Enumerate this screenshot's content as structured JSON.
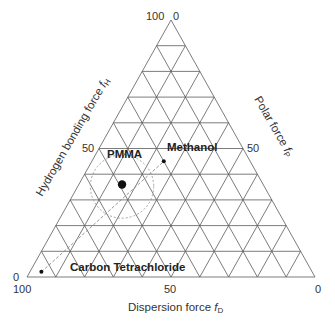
{
  "chart_data": {
    "type": "ternary",
    "title": "",
    "axes": {
      "bottom": {
        "label": "Dispersion force ",
        "sub": "D",
        "var": "f",
        "ticks": [
          "100",
          "50",
          "0"
        ],
        "direction": "100 at left, 0 at right"
      },
      "left": {
        "label": "Hydrogen bonding force ",
        "sub": "H",
        "var": "f",
        "ticks": [
          "0",
          "50",
          "100"
        ],
        "direction": "0 at bottom-left, 100 at apex"
      },
      "right": {
        "label": "Polar force ",
        "sub": "P",
        "var": "f",
        "ticks": [
          "0",
          "50"
        ],
        "direction": "0 at apex, 100 at bottom-right"
      }
    },
    "grid": {
      "divisions": 10,
      "step": 10
    },
    "points": [
      {
        "name": "PMMA",
        "fD": 49,
        "fP": 15,
        "fH": 36,
        "size": "large"
      },
      {
        "name": "Methanol",
        "fD": 30,
        "fP": 25,
        "fH": 45,
        "size": "small"
      },
      {
        "name": "Carbon Tetrachloride",
        "fD": 94,
        "fP": 4,
        "fH": 2,
        "size": "small"
      }
    ],
    "annotations": [
      {
        "type": "dotted-circle",
        "center": "PMMA",
        "radius_units": 11
      },
      {
        "type": "dashed-line",
        "from": "Carbon Tetrachloride",
        "to": "Methanol"
      }
    ]
  },
  "labels": {
    "apex_left": "100",
    "apex_right": "0",
    "left_mid": "50",
    "right_mid": "50",
    "bl_left": "0",
    "bl_bottom": "100",
    "bottom_mid": "50",
    "br": "0",
    "pmma": "PMMA",
    "methanol": "Methanol",
    "ccl4": "Carbon Tetrachloride",
    "x_axis": "Dispersion force ",
    "x_axis_var": "f",
    "x_axis_sub": "D",
    "left_axis": "Hydrogen bonding force ",
    "left_axis_var": "f",
    "left_axis_sub": "H",
    "right_axis": "Polar force ",
    "right_axis_var": "f",
    "right_axis_sub": "P"
  },
  "colors": {
    "grid": "#555555",
    "text": "#333333",
    "points": "#111111",
    "dashed": "#888888"
  }
}
